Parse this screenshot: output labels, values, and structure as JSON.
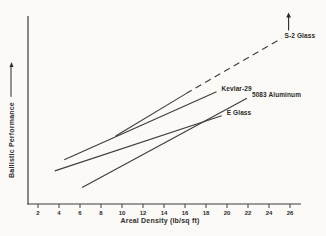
{
  "figure": {
    "kind": "scanned-line-chart",
    "background": "#fbfaf7",
    "ink": "#2f2f2f",
    "line_color": "#3c3c3c"
  },
  "chart_data": {
    "type": "line",
    "title": "",
    "xlabel": "Areal Density (lb/sq ft)",
    "ylabel": "Ballistic Performance",
    "ylabel_arrow_icon": "up-arrow",
    "x_ticks": [
      2,
      4,
      6,
      8,
      10,
      12,
      14,
      16,
      18,
      20,
      22,
      24,
      26
    ],
    "xlim": [
      1,
      27
    ],
    "ylim": [
      0,
      102
    ],
    "y_ticks": [],
    "grid": false,
    "legend_position": "inline-labels",
    "series": [
      {
        "name": "S-2 Glass",
        "style": "solid",
        "x": [
          9.4,
          16.1
        ],
        "y": [
          37,
          60
        ],
        "extension": {
          "style": "dashed",
          "x": [
            16.1,
            25.2
          ],
          "y": [
            60,
            90
          ]
        },
        "annotation_icon": "up-arrow"
      },
      {
        "name": "Kevlar-29",
        "style": "solid",
        "x": [
          4.5,
          19.0
        ],
        "y": [
          24,
          61
        ]
      },
      {
        "name": "5083 Aluminum",
        "style": "solid",
        "x": [
          6.2,
          21.9
        ],
        "y": [
          9,
          57.5
        ]
      },
      {
        "name": "E Glass",
        "style": "solid",
        "x": [
          3.6,
          19.5
        ],
        "y": [
          18,
          48
        ]
      }
    ]
  }
}
